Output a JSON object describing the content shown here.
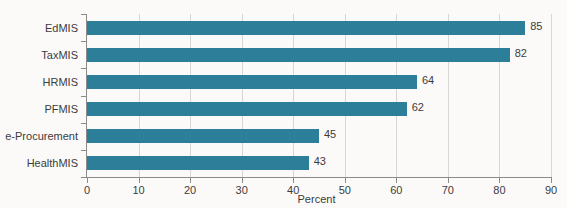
{
  "chart_data": {
    "type": "bar",
    "orientation": "horizontal",
    "title": "",
    "subtitle": "",
    "categories": [
      "EdMIS",
      "TaxMIS",
      "HRMIS",
      "PFMIS",
      "e-Procurement",
      "HealthMIS"
    ],
    "values": [
      85,
      82,
      64,
      62,
      45,
      43
    ],
    "value_labels": [
      "85",
      "82",
      "64",
      "62",
      "45",
      "43"
    ],
    "series": [
      {
        "name": "Percent",
        "values": [
          85,
          82,
          64,
          62,
          45,
          43
        ]
      }
    ],
    "xlabel": "Percent",
    "ylabel": "",
    "xlim": [
      0,
      90
    ],
    "xticks": [
      0,
      10,
      20,
      30,
      40,
      50,
      60,
      70,
      80,
      90
    ],
    "xtick_labels": [
      "0",
      "10",
      "20",
      "30",
      "40",
      "50",
      "60",
      "70",
      "80",
      "90"
    ],
    "grid": "vertical",
    "legend": "none",
    "bar_color": "#2d7e99",
    "axis_color": "#8d8b89",
    "gridline_color": "#d8d6d4",
    "text_color": "#3c3c3c",
    "background_color": "#fbfaf8"
  }
}
